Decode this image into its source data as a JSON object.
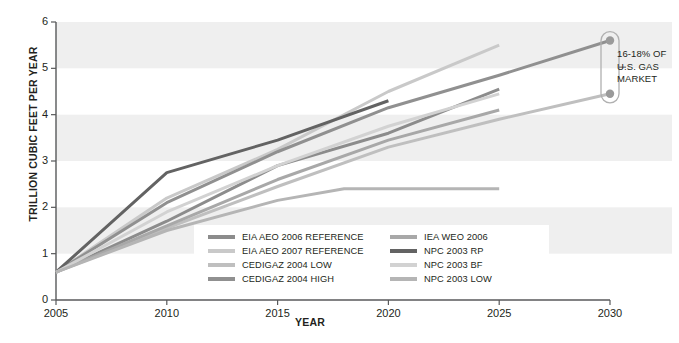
{
  "chart_data": {
    "type": "line",
    "title": "",
    "xlabel": "YEAR",
    "ylabel": "TRILLION CUBIC FEET PER YEAR",
    "xlim": [
      2005,
      2030
    ],
    "ylim": [
      0,
      6
    ],
    "xticks": [
      "2005",
      "2010",
      "2015",
      "2020",
      "2025",
      "2030"
    ],
    "yticks": [
      "0",
      "1",
      "2",
      "3",
      "4",
      "5",
      "6"
    ],
    "grid": false,
    "bands": [
      [
        1,
        2
      ],
      [
        3,
        4
      ],
      [
        5,
        6
      ]
    ],
    "legend_position": "inside-bottom-center",
    "series": [
      {
        "name": "EIA AEO 2006 REFERENCE",
        "color": "#8c8c8c",
        "x": [
          2005,
          2010,
          2015,
          2020,
          2025
        ],
        "values": [
          0.6,
          1.7,
          2.9,
          3.6,
          4.55
        ]
      },
      {
        "name": "EIA AEO 2007 REFERENCE",
        "color": "#c9c9c9",
        "x": [
          2005,
          2010,
          2015,
          2020,
          2025
        ],
        "values": [
          0.6,
          2.2,
          3.25,
          4.5,
          5.5
        ]
      },
      {
        "name": "CEDIGAZ 2004 LOW",
        "color": "#bfbfbf",
        "x": [
          2005,
          2010,
          2015,
          2020,
          2025,
          2030
        ],
        "values": [
          0.6,
          1.55,
          2.45,
          3.3,
          3.9,
          4.45
        ]
      },
      {
        "name": "CEDIGAZ 2004 HIGH",
        "color": "#909090",
        "x": [
          2005,
          2010,
          2015,
          2020,
          2025,
          2030
        ],
        "values": [
          0.6,
          2.1,
          3.2,
          4.15,
          4.85,
          5.6
        ]
      },
      {
        "name": "IEA WEO 2006",
        "color": "#a8a8a8",
        "x": [
          2005,
          2010,
          2015,
          2020,
          2025
        ],
        "values": [
          0.6,
          1.6,
          2.6,
          3.45,
          4.1
        ]
      },
      {
        "name": "NPC 2003 RP",
        "color": "#636363",
        "x": [
          2005,
          2010,
          2015,
          2020
        ],
        "values": [
          0.6,
          2.75,
          3.45,
          4.3
        ]
      },
      {
        "name": "NPC 2003 BF",
        "color": "#d2d2d2",
        "x": [
          2005,
          2010,
          2015,
          2020,
          2025
        ],
        "values": [
          0.6,
          1.9,
          2.9,
          3.75,
          4.45
        ]
      },
      {
        "name": "NPC 2003 LOW",
        "color": "#b5b5b5",
        "x": [
          2005,
          2010,
          2015,
          2018,
          2025
        ],
        "values": [
          0.6,
          1.5,
          2.15,
          2.4,
          2.4
        ]
      }
    ],
    "markers": [
      {
        "x": 2030,
        "y": 5.6,
        "series": "CEDIGAZ 2004 HIGH"
      },
      {
        "x": 2030,
        "y": 4.45,
        "series": "CEDIGAZ 2004 LOW"
      }
    ],
    "annotations": [
      {
        "text": "16-18% OF U.S. GAS MARKET",
        "lines": [
          "16-18% OF",
          "U.S. GAS",
          "MARKET"
        ],
        "at_x": 2030,
        "spans_y": [
          4.45,
          5.6
        ]
      }
    ]
  },
  "legend": {
    "left_column": [
      {
        "label": "EIA AEO 2006 REFERENCE",
        "color": "#8c8c8c"
      },
      {
        "label": "EIA AEO 2007 REFERENCE",
        "color": "#c9c9c9"
      },
      {
        "label": "CEDIGAZ 2004 LOW",
        "color": "#bfbfbf"
      },
      {
        "label": "CEDIGAZ 2004 HIGH",
        "color": "#909090"
      }
    ],
    "right_column": [
      {
        "label": "IEA WEO 2006",
        "color": "#a8a8a8"
      },
      {
        "label": "NPC 2003 RP",
        "color": "#636363"
      },
      {
        "label": "NPC 2003 BF",
        "color": "#d2d2d2"
      },
      {
        "label": "NPC 2003 LOW",
        "color": "#b5b5b5"
      }
    ]
  },
  "footnote": {
    "text": ""
  },
  "style": {
    "band_color": "#efefef",
    "axis_color": "#58595b",
    "text_color": "#231f20",
    "background": "#ffffff"
  }
}
